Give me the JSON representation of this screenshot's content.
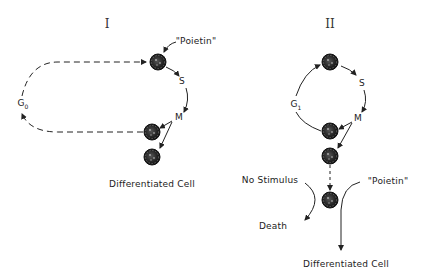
{
  "diagram_I": {
    "title": "I",
    "labels": {
      "poietin": "\"Poietin\"",
      "s_phase": "S",
      "m_phase": "M",
      "g0": "G",
      "g0_sub": "0",
      "differentiated": "Differentiated Cell"
    }
  },
  "diagram_II": {
    "title": "II",
    "labels": {
      "s_phase": "S",
      "m_phase": "M",
      "g1": "G",
      "g1_sub": "1",
      "no_stimulus": "No Stimulus",
      "death": "Death",
      "poietin": "\"Poietin\"",
      "differentiated": "Differentiated Cell"
    }
  },
  "colors": {
    "ink": "#222222",
    "cell_fill": "#2a2a2a",
    "background": "#ffffff"
  }
}
